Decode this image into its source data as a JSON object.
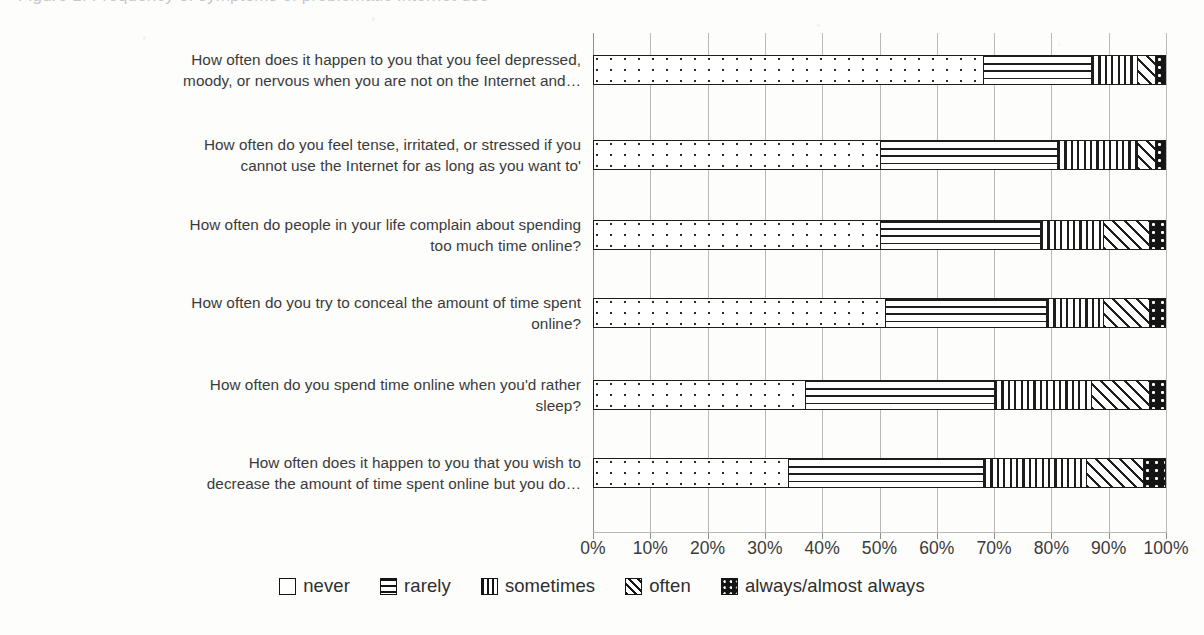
{
  "figure": {
    "cutoff_caption": "Figure 1. Frequency of symptoms of problematic Internet use"
  },
  "axis": {
    "ticks": [
      "0%",
      "10%",
      "20%",
      "30%",
      "40%",
      "50%",
      "60%",
      "70%",
      "80%",
      "90%",
      "100%"
    ]
  },
  "legend": {
    "items": [
      {
        "label": "never",
        "pattern": "open-white",
        "swatch": "sw-never"
      },
      {
        "label": "rarely",
        "pattern": "horizontal-lines",
        "swatch": "sw-rarely"
      },
      {
        "label": "sometimes",
        "pattern": "vertical-lines",
        "swatch": "sw-sometimes"
      },
      {
        "label": "often",
        "pattern": "diagonal-hatch",
        "swatch": "sw-often"
      },
      {
        "label": "always/almost always",
        "pattern": "black-dotted",
        "swatch": "sw-always"
      }
    ]
  },
  "chart_data": {
    "type": "bar",
    "orientation": "horizontal",
    "stacked": true,
    "stack_mode": "percent",
    "title": "",
    "xlabel": "",
    "ylabel": "",
    "xlim": [
      0,
      100
    ],
    "xticks": [
      0,
      10,
      20,
      30,
      40,
      50,
      60,
      70,
      80,
      90,
      100
    ],
    "grid": true,
    "legend_position": "bottom",
    "categories": [
      "How often does it happen to you that you feel depressed, moody, or nervous when you are not on the Internet and…",
      "How often do you feel tense, irritated, or stressed if you cannot use the Internet for as long as you want to'",
      "How often do people in your life complain about spending too much time online?",
      "How often do you try to conceal the amount of time spent online?",
      "How often do you spend time online when you'd rather sleep?",
      "How often does it happen to you that you wish to decrease the amount of time spent online but you do…"
    ],
    "categories_display": [
      [
        "How often does it happen to you that you feel depressed,",
        "moody, or nervous when you are not on the Internet and…"
      ],
      [
        "How often do you feel tense, irritated, or stressed if you",
        "cannot use the Internet for as long as you want to'"
      ],
      [
        "How often do people in your life complain about spending",
        "too much time online?"
      ],
      [
        "How often do you try to conceal the amount of time spent",
        "online?"
      ],
      [
        "How often do you spend time online when you'd rather",
        "sleep?"
      ],
      [
        "How often does it happen to you that you wish to",
        "decrease the amount of time spent online but you do…"
      ]
    ],
    "series": [
      {
        "name": "never",
        "values": [
          68,
          50,
          50,
          51,
          37,
          34
        ]
      },
      {
        "name": "rarely",
        "values": [
          19,
          31,
          28,
          28,
          33,
          34
        ]
      },
      {
        "name": "sometimes",
        "values": [
          8,
          14,
          11,
          10,
          17,
          18
        ]
      },
      {
        "name": "often",
        "values": [
          3,
          3,
          8,
          8,
          10,
          10
        ]
      },
      {
        "name": "always/almost always",
        "values": [
          2,
          2,
          3,
          3,
          3,
          4
        ]
      }
    ]
  }
}
